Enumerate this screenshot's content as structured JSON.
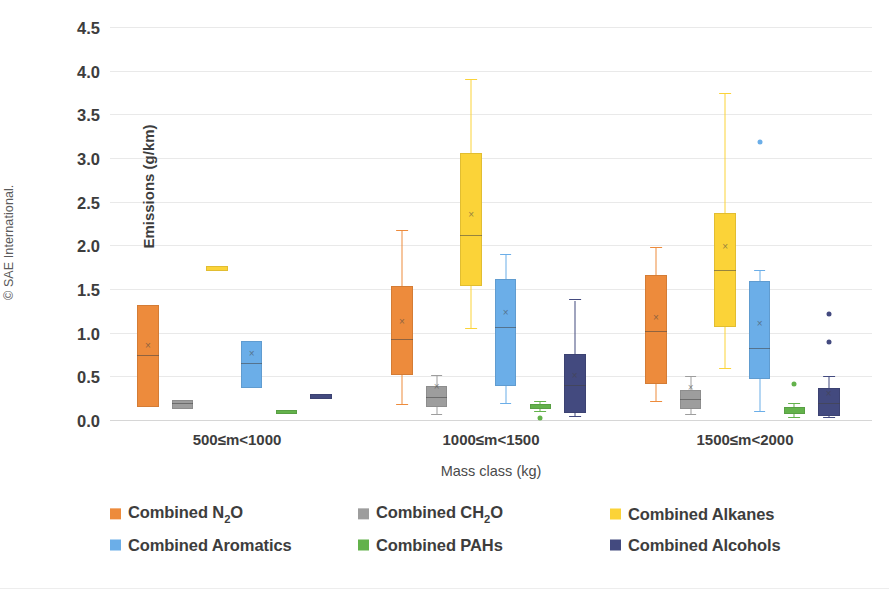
{
  "credit": "© SAE International.",
  "chart_data": {
    "type": "box",
    "title": "",
    "xlabel": "Mass class (kg)",
    "ylabel": "Emissions (g/km)",
    "ylim": [
      0.0,
      4.5
    ],
    "ytick_labels": [
      "0.0",
      "0.5",
      "1.0",
      "1.5",
      "2.0",
      "2.5",
      "3.0",
      "3.5",
      "4.0",
      "4.5"
    ],
    "ytick_values": [
      0.0,
      0.5,
      1.0,
      1.5,
      2.0,
      2.5,
      3.0,
      3.5,
      4.0,
      4.5
    ],
    "grid": true,
    "legend_position": "bottom",
    "categories": [
      "500≤m<1000",
      "1000≤m<1500",
      "1500≤m<2000"
    ],
    "series": [
      {
        "name": "Combined N₂O",
        "name_base": "Combined N",
        "name_sub": "2",
        "name_tail": "O",
        "color": "#ED8B3C",
        "boxes": [
          {
            "whisker_low": 0.16,
            "q1": 0.16,
            "median": 0.74,
            "mean": 0.74,
            "q3": 1.33,
            "whisker_high": 1.33,
            "outliers": []
          },
          {
            "whisker_low": 0.18,
            "q1": 0.53,
            "median": 0.93,
            "mean": 1.02,
            "q3": 1.55,
            "whisker_high": 2.18,
            "outliers": []
          },
          {
            "whisker_low": 0.22,
            "q1": 0.42,
            "median": 1.02,
            "mean": 1.07,
            "q3": 1.67,
            "whisker_high": 1.98,
            "outliers": []
          }
        ]
      },
      {
        "name": "Combined CH₂O",
        "name_base": "Combined CH",
        "name_sub": "2",
        "name_tail": "O",
        "color": "#9D9D9D",
        "boxes": [
          {
            "whisker_low": 0.14,
            "q1": 0.14,
            "median": 0.2,
            "mean": 0.2,
            "q3": 0.24,
            "whisker_high": 0.24,
            "outliers": []
          },
          {
            "whisker_low": 0.07,
            "q1": 0.16,
            "median": 0.26,
            "mean": 0.27,
            "q3": 0.4,
            "whisker_high": 0.52,
            "outliers": []
          },
          {
            "whisker_low": 0.07,
            "q1": 0.14,
            "median": 0.24,
            "mean": 0.26,
            "q3": 0.35,
            "whisker_high": 0.5,
            "outliers": []
          }
        ]
      },
      {
        "name": "Combined Alkanes",
        "name_base": "Combined Alkanes",
        "name_sub": "",
        "name_tail": "",
        "color": "#FBD338",
        "boxes": [
          {
            "whisker_low": 1.72,
            "q1": 1.72,
            "median": 1.75,
            "mean": 1.75,
            "q3": 1.78,
            "whisker_high": 1.78,
            "outliers": []
          },
          {
            "whisker_low": 1.05,
            "q1": 1.55,
            "median": 2.12,
            "mean": 2.24,
            "q3": 3.07,
            "whisker_high": 3.9,
            "outliers": []
          },
          {
            "whisker_low": 0.6,
            "q1": 1.08,
            "median": 1.72,
            "mean": 1.88,
            "q3": 2.38,
            "whisker_high": 3.75,
            "outliers": []
          }
        ]
      },
      {
        "name": "Combined Aromatics",
        "name_base": "Combined Aromatics",
        "name_sub": "",
        "name_tail": "",
        "color": "#6BAEE8",
        "boxes": [
          {
            "whisker_low": 0.38,
            "q1": 0.38,
            "median": 0.65,
            "mean": 0.65,
            "q3": 0.92,
            "whisker_high": 0.92,
            "outliers": []
          },
          {
            "whisker_low": 0.2,
            "q1": 0.4,
            "median": 1.07,
            "mean": 1.12,
            "q3": 1.63,
            "whisker_high": 1.9,
            "outliers": []
          },
          {
            "whisker_low": 0.1,
            "q1": 0.48,
            "median": 0.82,
            "mean": 1.0,
            "q3": 1.6,
            "whisker_high": 1.72,
            "outliers": [
              3.2
            ]
          }
        ]
      },
      {
        "name": "Combined PAHs",
        "name_base": "Combined PAHs",
        "name_sub": "",
        "name_tail": "",
        "color": "#63B24B",
        "boxes": [
          {
            "whisker_low": 0.08,
            "q1": 0.08,
            "median": 0.1,
            "mean": 0.1,
            "q3": 0.13,
            "whisker_high": 0.13,
            "outliers": []
          },
          {
            "whisker_low": 0.1,
            "q1": 0.14,
            "median": 0.17,
            "mean": 0.17,
            "q3": 0.2,
            "whisker_high": 0.22,
            "outliers": [
              0.04
            ]
          },
          {
            "whisker_low": 0.03,
            "q1": 0.08,
            "median": 0.12,
            "mean": 0.12,
            "q3": 0.16,
            "whisker_high": 0.2,
            "outliers": [
              0.42
            ]
          }
        ]
      },
      {
        "name": "Combined Alcohols",
        "name_base": "Combined Alcohols",
        "name_sub": "",
        "name_tail": "",
        "color": "#434A7F",
        "boxes": [
          {
            "whisker_low": 0.25,
            "q1": 0.25,
            "median": 0.28,
            "mean": 0.28,
            "q3": 0.31,
            "whisker_high": 0.31,
            "outliers": []
          },
          {
            "whisker_low": 0.05,
            "q1": 0.09,
            "median": 0.4,
            "mean": 0.4,
            "q3": 0.77,
            "whisker_high": 1.38,
            "outliers": []
          },
          {
            "whisker_low": 0.04,
            "q1": 0.06,
            "median": 0.2,
            "mean": 0.2,
            "q3": 0.38,
            "whisker_high": 0.5,
            "outliers": [
              1.22,
              0.9
            ]
          }
        ]
      }
    ]
  }
}
